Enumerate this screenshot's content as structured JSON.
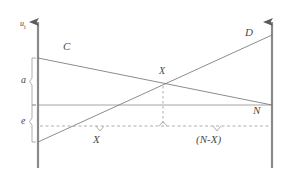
{
  "figure": {
    "background_color": "#ffffff",
    "line_color": "#6b6b6b",
    "axis_color": "#7a7a7a",
    "text_color": "#4a4a4a",
    "width": 307,
    "height": 176
  },
  "axes": {
    "y_axis_label": "u",
    "y_axis_subscript": "i",
    "left_axis_x": 38,
    "right_axis_x": 272,
    "baseline_y": 105,
    "dashed_baseline_y": 126,
    "arrow_top_y": 18
  },
  "curves": [
    {
      "name": "C",
      "label": "C",
      "label_x": 63,
      "label_y": 46,
      "from_x": 38,
      "from_y": 58,
      "to_x": 272,
      "to_y": 105
    },
    {
      "name": "D",
      "label": "D",
      "label_x": 245,
      "label_y": 32,
      "from_x": 38,
      "from_y": 142,
      "to_x": 272,
      "to_y": 35
    }
  ],
  "intersection": {
    "label": "X",
    "x": 163,
    "y": 86,
    "label_x": 160,
    "label_y": 70
  },
  "braces": [
    {
      "name": "a",
      "label": "a",
      "label_x": 23,
      "label_y": 80,
      "top_y": 58,
      "bottom_y": 105,
      "x": 33
    },
    {
      "name": "e",
      "label": "e",
      "label_x": 23,
      "label_y": 121,
      "top_y": 105,
      "bottom_y": 142,
      "x": 33
    }
  ],
  "segments": [
    {
      "name": "X",
      "label": "X",
      "label_x": 93,
      "label_y": 140,
      "from_x": 38,
      "to_x": 163,
      "tick_x": 100
    },
    {
      "name": "N-X",
      "label": "(N-X)",
      "label_x": 196,
      "label_y": 140,
      "from_x": 163,
      "to_x": 272,
      "tick_x": 217
    }
  ],
  "markers": [
    {
      "name": "N",
      "label": "N",
      "label_x": 253,
      "label_y": 110
    }
  ]
}
